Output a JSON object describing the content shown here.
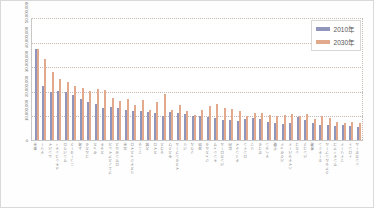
{
  "chart_data": {
    "type": "bar",
    "title": "",
    "subtitle": "",
    "xlabel": "",
    "ylabel": "",
    "ylim": [
      0,
      50000000
    ],
    "grid": true,
    "legend_position": "top-right",
    "y_ticks": [
      "50,000,000",
      "40,000,000",
      "30,000,000",
      "20,000,000",
      "10,000,000",
      "0"
    ],
    "y_tick_values": [
      50000000,
      40000000,
      30000000,
      20000000,
      10000000,
      0
    ],
    "categories": [
      "東京",
      "デリー",
      "ムンバイ",
      "メキシコシティ",
      "サンパウロ",
      "ニューヨーク",
      "上海",
      "コルカタ",
      "ダッカ",
      "カラチ",
      "ブエノスアイレス",
      "ロサンゼルス",
      "北京",
      "リオデジャネイロ",
      "マニラ",
      "大阪",
      "カイロ",
      "ラゴス",
      "モスクワ",
      "イスタンブール",
      "パリ",
      "ソウル",
      "深圳",
      "ジャカルタ",
      "キンシャサ",
      "バンガロール",
      "広州",
      "チェンナイ",
      "ロンドン",
      "リマ",
      "ボゴタ",
      "テヘラン",
      "重慶",
      "バグダッド",
      "ハイデラバード",
      "シカゴ",
      "バンコク",
      "香港",
      "ホーチミン",
      "クアラルンプール",
      "サンティアゴ",
      "マドリード",
      "トロント",
      "シンガポール"
    ],
    "series": [
      {
        "name": "2010年",
        "color": "#9095bb",
        "values": [
          36900000,
          21900000,
          19400000,
          20100000,
          19600000,
          18400000,
          16600000,
          15600000,
          14700000,
          13100000,
          13400000,
          13200000,
          12400000,
          11900000,
          11600000,
          11300000,
          11000000,
          9600000,
          11500000,
          10900000,
          10500000,
          9800000,
          9600000,
          9200000,
          8800000,
          8300000,
          8000000,
          7600000,
          8600000,
          8900000,
          8500000,
          7300000,
          7100000,
          6700000,
          6800000,
          9200000,
          8200000,
          7100000,
          6200000,
          6100000,
          5900000,
          6300000,
          5600000,
          5100000
        ]
      },
      {
        "name": "2030年",
        "color": "#e3a98c",
        "values": [
          37200000,
          32900000,
          27800000,
          24600000,
          23400000,
          22100000,
          21300000,
          20100000,
          20900000,
          20200000,
          16900000,
          15700000,
          16500000,
          14400000,
          16300000,
          12000000,
          15600000,
          18900000,
          12200000,
          14200000,
          11800000,
          10300000,
          12300000,
          13800000,
          14500000,
          13100000,
          12700000,
          11900000,
          9800000,
          10900000,
          10800000,
          10100000,
          9600000,
          10300000,
          10600000,
          9900000,
          10400000,
          8400000,
          9600000,
          8900000,
          7200000,
          7100000,
          7400000,
          6900000
        ]
      }
    ]
  },
  "legend": {
    "items": [
      {
        "label": "2010年",
        "color": "#9095bb"
      },
      {
        "label": "2030年",
        "color": "#e3a98c"
      }
    ]
  }
}
